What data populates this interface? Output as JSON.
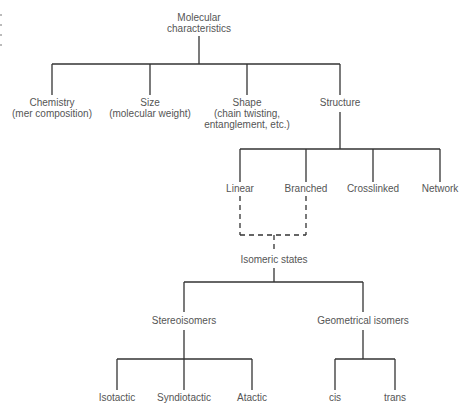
{
  "diagram": {
    "type": "tree",
    "line_color": "#333333",
    "text_color": "#555555",
    "root": {
      "id": "molecular-characteristics",
      "lines": [
        "Molecular",
        "characteristics"
      ]
    },
    "level1": [
      {
        "id": "chemistry",
        "lines": [
          "Chemistry",
          "(mer composition)"
        ]
      },
      {
        "id": "size",
        "lines": [
          "Size",
          "(molecular weight)"
        ]
      },
      {
        "id": "shape",
        "lines": [
          "Shape",
          "(chain twisting,",
          "entanglement, etc.)"
        ]
      },
      {
        "id": "structure",
        "lines": [
          "Structure"
        ]
      }
    ],
    "structure_children": [
      {
        "id": "linear",
        "label": "Linear"
      },
      {
        "id": "branched",
        "label": "Branched"
      },
      {
        "id": "crosslinked",
        "label": "Crosslinked"
      },
      {
        "id": "network",
        "label": "Network"
      }
    ],
    "isomeric": {
      "id": "isomeric-states",
      "label": "Isomeric states",
      "connector_style": "dashed",
      "from": [
        "linear",
        "branched"
      ]
    },
    "isomer_types": [
      {
        "id": "stereoisomers",
        "label": "Stereoisomers"
      },
      {
        "id": "geometrical-isomers",
        "label": "Geometrical isomers"
      }
    ],
    "stereo_children": [
      {
        "id": "isotactic",
        "label": "Isotactic"
      },
      {
        "id": "syndiotactic",
        "label": "Syndiotactic"
      },
      {
        "id": "atactic",
        "label": "Atactic"
      }
    ],
    "geometrical_children": [
      {
        "id": "cis",
        "label": "cis"
      },
      {
        "id": "trans",
        "label": "trans"
      }
    ]
  }
}
